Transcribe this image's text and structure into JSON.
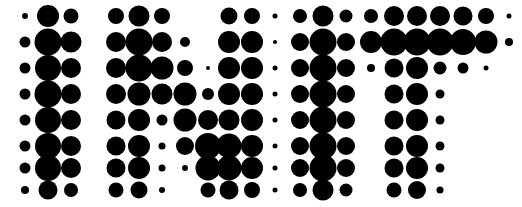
{
  "artwork": {
    "title": "INIT",
    "type": "halftone-dot-matrix-text",
    "word": "INIT",
    "letters": [
      "I",
      "N",
      "I",
      "T"
    ],
    "background_color": "#ffffff",
    "dot_color": "#000000",
    "canvas": {
      "width": 522,
      "height": 207
    },
    "grid": {
      "columns": 23,
      "rows": 8,
      "col_spacing": 22.6,
      "row_spacing": 25.0,
      "origin_x": 25,
      "origin_y": 16,
      "max_radius": 13.5,
      "min_radius": 2.0
    },
    "dots": [
      {
        "x": 25,
        "y": 16,
        "r": 3.0
      },
      {
        "x": 48,
        "y": 16,
        "r": 11.0
      },
      {
        "x": 71,
        "y": 16,
        "r": 7.5
      },
      {
        "x": 116,
        "y": 16,
        "r": 8.0
      },
      {
        "x": 139,
        "y": 16,
        "r": 10.5
      },
      {
        "x": 162,
        "y": 16,
        "r": 8.0
      },
      {
        "x": 229,
        "y": 16,
        "r": 8.5
      },
      {
        "x": 252,
        "y": 16,
        "r": 8.0
      },
      {
        "x": 275,
        "y": 16,
        "r": 2.5
      },
      {
        "x": 300,
        "y": 16,
        "r": 7.0
      },
      {
        "x": 323,
        "y": 16,
        "r": 10.5
      },
      {
        "x": 346,
        "y": 16,
        "r": 6.5
      },
      {
        "x": 371,
        "y": 16,
        "r": 7.0
      },
      {
        "x": 394,
        "y": 16,
        "r": 10.0
      },
      {
        "x": 417,
        "y": 16,
        "r": 10.0
      },
      {
        "x": 440,
        "y": 16,
        "r": 10.0
      },
      {
        "x": 463,
        "y": 16,
        "r": 9.5
      },
      {
        "x": 486,
        "y": 16,
        "r": 8.0
      },
      {
        "x": 509,
        "y": 16,
        "r": 2.5
      },
      {
        "x": 25,
        "y": 42,
        "r": 5.5
      },
      {
        "x": 48,
        "y": 42,
        "r": 13.5
      },
      {
        "x": 71,
        "y": 42,
        "r": 10.5
      },
      {
        "x": 116,
        "y": 42,
        "r": 10.0
      },
      {
        "x": 139,
        "y": 42,
        "r": 13.5
      },
      {
        "x": 162,
        "y": 42,
        "r": 10.0
      },
      {
        "x": 185,
        "y": 42,
        "r": 5.0
      },
      {
        "x": 229,
        "y": 42,
        "r": 11.0
      },
      {
        "x": 252,
        "y": 42,
        "r": 11.0
      },
      {
        "x": 275,
        "y": 42,
        "r": 2.0
      },
      {
        "x": 300,
        "y": 42,
        "r": 9.0
      },
      {
        "x": 323,
        "y": 42,
        "r": 13.5
      },
      {
        "x": 346,
        "y": 42,
        "r": 9.0
      },
      {
        "x": 371,
        "y": 42,
        "r": 11.0
      },
      {
        "x": 394,
        "y": 42,
        "r": 13.5
      },
      {
        "x": 417,
        "y": 42,
        "r": 13.5
      },
      {
        "x": 440,
        "y": 42,
        "r": 13.5
      },
      {
        "x": 463,
        "y": 42,
        "r": 13.0
      },
      {
        "x": 486,
        "y": 42,
        "r": 11.5
      },
      {
        "x": 509,
        "y": 42,
        "r": 4.0
      },
      {
        "x": 25,
        "y": 68,
        "r": 5.5
      },
      {
        "x": 48,
        "y": 68,
        "r": 13.0
      },
      {
        "x": 71,
        "y": 68,
        "r": 10.0
      },
      {
        "x": 116,
        "y": 68,
        "r": 10.0
      },
      {
        "x": 139,
        "y": 68,
        "r": 13.5
      },
      {
        "x": 162,
        "y": 68,
        "r": 11.5
      },
      {
        "x": 185,
        "y": 68,
        "r": 8.0
      },
      {
        "x": 208,
        "y": 68,
        "r": 2.0
      },
      {
        "x": 229,
        "y": 68,
        "r": 11.0
      },
      {
        "x": 252,
        "y": 68,
        "r": 11.0
      },
      {
        "x": 275,
        "y": 68,
        "r": 2.5
      },
      {
        "x": 300,
        "y": 68,
        "r": 9.0
      },
      {
        "x": 323,
        "y": 68,
        "r": 13.5
      },
      {
        "x": 346,
        "y": 68,
        "r": 9.0
      },
      {
        "x": 371,
        "y": 68,
        "r": 4.0
      },
      {
        "x": 394,
        "y": 68,
        "r": 9.5
      },
      {
        "x": 417,
        "y": 68,
        "r": 11.0
      },
      {
        "x": 440,
        "y": 68,
        "r": 6.5
      },
      {
        "x": 463,
        "y": 68,
        "r": 5.5
      },
      {
        "x": 486,
        "y": 68,
        "r": 2.5
      },
      {
        "x": 25,
        "y": 94,
        "r": 5.5
      },
      {
        "x": 48,
        "y": 94,
        "r": 13.5
      },
      {
        "x": 71,
        "y": 94,
        "r": 10.0
      },
      {
        "x": 116,
        "y": 94,
        "r": 10.0
      },
      {
        "x": 139,
        "y": 94,
        "r": 11.5
      },
      {
        "x": 162,
        "y": 94,
        "r": 10.5
      },
      {
        "x": 185,
        "y": 94,
        "r": 11.5
      },
      {
        "x": 208,
        "y": 94,
        "r": 6.0
      },
      {
        "x": 229,
        "y": 94,
        "r": 11.0
      },
      {
        "x": 252,
        "y": 94,
        "r": 11.0
      },
      {
        "x": 275,
        "y": 94,
        "r": 2.5
      },
      {
        "x": 300,
        "y": 94,
        "r": 9.0
      },
      {
        "x": 323,
        "y": 94,
        "r": 13.5
      },
      {
        "x": 346,
        "y": 94,
        "r": 9.0
      },
      {
        "x": 394,
        "y": 94,
        "r": 9.5
      },
      {
        "x": 417,
        "y": 94,
        "r": 11.0
      },
      {
        "x": 440,
        "y": 94,
        "r": 4.5
      },
      {
        "x": 25,
        "y": 120,
        "r": 5.5
      },
      {
        "x": 48,
        "y": 120,
        "r": 13.0
      },
      {
        "x": 71,
        "y": 120,
        "r": 10.0
      },
      {
        "x": 116,
        "y": 120,
        "r": 9.5
      },
      {
        "x": 139,
        "y": 120,
        "r": 11.0
      },
      {
        "x": 162,
        "y": 120,
        "r": 5.5
      },
      {
        "x": 185,
        "y": 120,
        "r": 11.5
      },
      {
        "x": 208,
        "y": 120,
        "r": 10.0
      },
      {
        "x": 229,
        "y": 120,
        "r": 10.5
      },
      {
        "x": 252,
        "y": 120,
        "r": 11.0
      },
      {
        "x": 275,
        "y": 120,
        "r": 2.5
      },
      {
        "x": 300,
        "y": 120,
        "r": 9.0
      },
      {
        "x": 323,
        "y": 120,
        "r": 13.5
      },
      {
        "x": 346,
        "y": 120,
        "r": 9.0
      },
      {
        "x": 394,
        "y": 120,
        "r": 9.5
      },
      {
        "x": 417,
        "y": 120,
        "r": 11.0
      },
      {
        "x": 440,
        "y": 120,
        "r": 4.5
      },
      {
        "x": 25,
        "y": 146,
        "r": 5.5
      },
      {
        "x": 48,
        "y": 146,
        "r": 13.0
      },
      {
        "x": 71,
        "y": 146,
        "r": 10.0
      },
      {
        "x": 116,
        "y": 146,
        "r": 9.5
      },
      {
        "x": 139,
        "y": 146,
        "r": 11.0
      },
      {
        "x": 162,
        "y": 146,
        "r": 3.5
      },
      {
        "x": 185,
        "y": 146,
        "r": 9.0
      },
      {
        "x": 208,
        "y": 146,
        "r": 13.0
      },
      {
        "x": 229,
        "y": 146,
        "r": 12.5
      },
      {
        "x": 252,
        "y": 146,
        "r": 11.0
      },
      {
        "x": 275,
        "y": 146,
        "r": 2.5
      },
      {
        "x": 300,
        "y": 146,
        "r": 9.0
      },
      {
        "x": 323,
        "y": 146,
        "r": 13.5
      },
      {
        "x": 346,
        "y": 146,
        "r": 9.0
      },
      {
        "x": 394,
        "y": 146,
        "r": 9.5
      },
      {
        "x": 417,
        "y": 146,
        "r": 11.0
      },
      {
        "x": 440,
        "y": 146,
        "r": 4.5
      },
      {
        "x": 25,
        "y": 168,
        "r": 5.5
      },
      {
        "x": 48,
        "y": 168,
        "r": 13.0
      },
      {
        "x": 71,
        "y": 168,
        "r": 10.0
      },
      {
        "x": 116,
        "y": 168,
        "r": 9.5
      },
      {
        "x": 139,
        "y": 168,
        "r": 11.0
      },
      {
        "x": 162,
        "y": 168,
        "r": 3.5
      },
      {
        "x": 185,
        "y": 168,
        "r": 3.0
      },
      {
        "x": 208,
        "y": 168,
        "r": 12.5
      },
      {
        "x": 229,
        "y": 168,
        "r": 12.5
      },
      {
        "x": 252,
        "y": 168,
        "r": 11.0
      },
      {
        "x": 275,
        "y": 168,
        "r": 2.5
      },
      {
        "x": 300,
        "y": 168,
        "r": 9.0
      },
      {
        "x": 323,
        "y": 168,
        "r": 13.5
      },
      {
        "x": 346,
        "y": 168,
        "r": 9.0
      },
      {
        "x": 394,
        "y": 168,
        "r": 9.5
      },
      {
        "x": 417,
        "y": 168,
        "r": 11.0
      },
      {
        "x": 440,
        "y": 168,
        "r": 4.5
      },
      {
        "x": 25,
        "y": 190,
        "r": 4.0
      },
      {
        "x": 48,
        "y": 190,
        "r": 9.5
      },
      {
        "x": 71,
        "y": 190,
        "r": 7.0
      },
      {
        "x": 116,
        "y": 190,
        "r": 7.5
      },
      {
        "x": 139,
        "y": 190,
        "r": 8.5
      },
      {
        "x": 162,
        "y": 190,
        "r": 3.0
      },
      {
        "x": 208,
        "y": 190,
        "r": 7.5
      },
      {
        "x": 229,
        "y": 190,
        "r": 9.5
      },
      {
        "x": 252,
        "y": 190,
        "r": 8.0
      },
      {
        "x": 275,
        "y": 190,
        "r": 2.5
      },
      {
        "x": 300,
        "y": 190,
        "r": 7.0
      },
      {
        "x": 323,
        "y": 190,
        "r": 10.5
      },
      {
        "x": 346,
        "y": 190,
        "r": 6.5
      },
      {
        "x": 394,
        "y": 190,
        "r": 7.5
      },
      {
        "x": 417,
        "y": 190,
        "r": 9.0
      },
      {
        "x": 440,
        "y": 190,
        "r": 3.5
      }
    ]
  }
}
